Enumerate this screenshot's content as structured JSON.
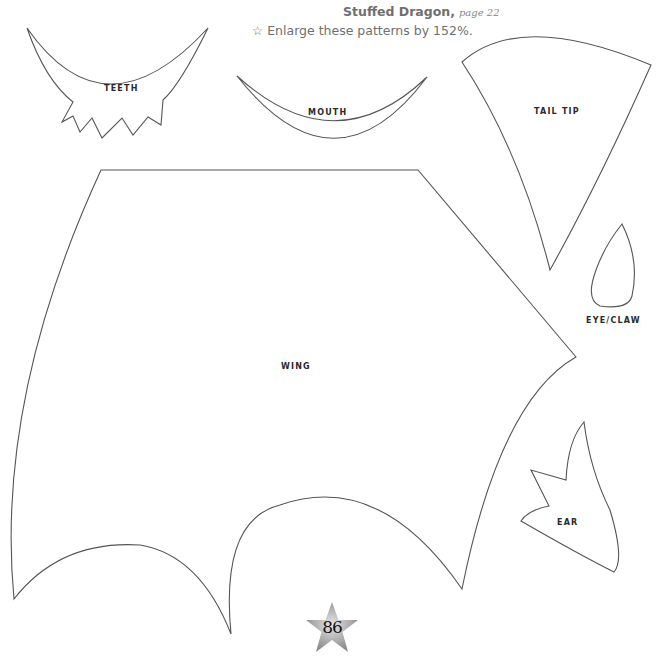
{
  "header": {
    "title_bold": "Stuffed Dragon,",
    "title_page_ref": "page 22",
    "subtitle_icon": "☆",
    "subtitle_text": "Enlarge these patterns by 152%."
  },
  "patterns": {
    "teeth": "TEETH",
    "mouth": "MOUTH",
    "tail_tip": "TAIL TIP",
    "eye_claw": "EYE/CLAW",
    "wing": "WING",
    "ear": "EAR"
  },
  "footer": {
    "page_number": "86"
  },
  "colors": {
    "outline": "#555555",
    "text_gray": "#6f6f6f",
    "label": "#2a2a2a",
    "star_gradient_light": "#d8d8d8",
    "star_gradient_dark": "#8a8a8a"
  }
}
